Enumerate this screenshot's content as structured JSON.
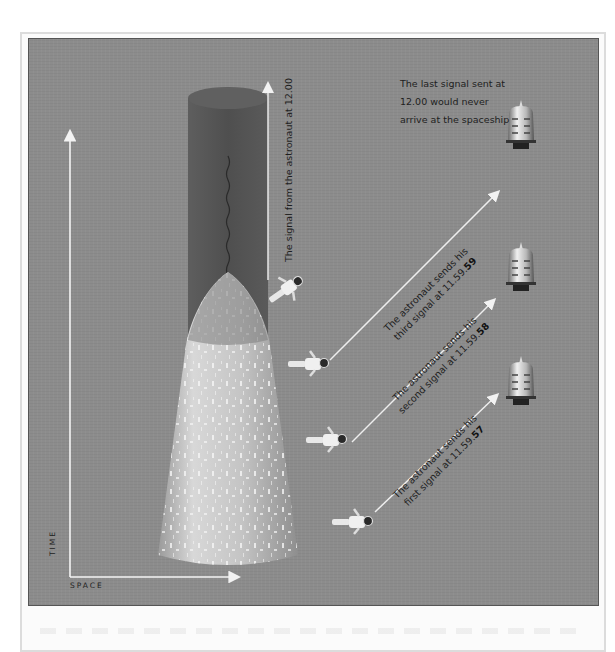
{
  "figure": {
    "axes": {
      "vertical_label": "TIME",
      "horizontal_label": "SPACE"
    },
    "signal_from_astronaut_label": "The signal from the astronaut at 12.00",
    "last_signal_note": {
      "line1": "The last signal sent at",
      "line2": "12.00 would never",
      "line3": "arrive at the spaceship"
    },
    "signals": [
      {
        "order": "third",
        "line1": "The astronaut sends his",
        "line2_prefix": "third signal at 11.59.",
        "line2_bold": "59"
      },
      {
        "order": "second",
        "line1": "The astronaut sends his",
        "line2_prefix": "second signal at 11.59.",
        "line2_bold": "58"
      },
      {
        "order": "first",
        "line1": "The astronaut sends his",
        "line2_prefix": "first signal at 11.59.",
        "line2_bold": "57"
      }
    ],
    "colors": {
      "panel_background": "#8c8c8c",
      "cylinder": "#555555",
      "cone": "#c8c8c8",
      "arrow": "#f2f2f2",
      "text": "#1e1e1e"
    }
  }
}
